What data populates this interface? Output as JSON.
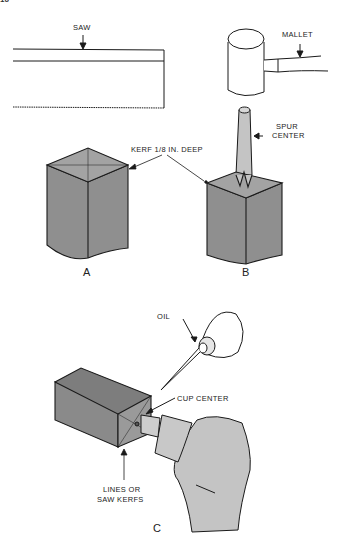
{
  "diagram": {
    "page_marker": "16",
    "figures": [
      {
        "id": "A",
        "label": "A"
      },
      {
        "id": "B",
        "label": "B"
      },
      {
        "id": "C",
        "label": "C"
      }
    ],
    "labels": {
      "saw": "SAW",
      "mallet": "MALLET",
      "spur_center_line1": "SPUR",
      "spur_center_line2": "CENTER",
      "kerf": "KERF 1/8 IN. DEEP",
      "oil": "OIL",
      "cup_center": "CUP CENTER",
      "lines_line1": "LINES OR",
      "lines_line2": "SAW KERFS"
    },
    "colors": {
      "stroke": "#1a1a1a",
      "block_fill": "#8f8f8f",
      "block_top": "#a3a3a3",
      "tool_fill": "#c4c4c4",
      "background": "#ffffff"
    }
  }
}
